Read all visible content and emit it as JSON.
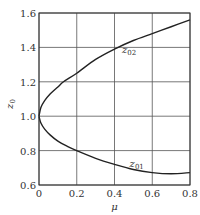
{
  "chart_data": {
    "type": "line",
    "title": "",
    "xlabel": "μ",
    "ylabel": "z",
    "ylabel_sub": "0",
    "xlim": [
      0,
      0.8
    ],
    "ylim": [
      0.6,
      1.6
    ],
    "grid": true,
    "x_ticks": [
      0,
      0.2,
      0.4,
      0.6,
      0.8
    ],
    "x_tick_labels": [
      "0",
      "0.2",
      "0.4",
      "0.6",
      "0.8"
    ],
    "y_ticks": [
      0.6,
      0.8,
      1.0,
      1.2,
      1.4,
      1.6
    ],
    "y_tick_labels": [
      "0.6",
      "0.8",
      "1.0",
      "1.2",
      "1.4",
      "1.6"
    ],
    "series": [
      {
        "name": "z02",
        "label_main": "z",
        "label_sub": "02",
        "label_at": [
          0.44,
          1.37
        ],
        "x": [
          0,
          0.01,
          0.03,
          0.06,
          0.1,
          0.13,
          0.2,
          0.3,
          0.4,
          0.5,
          0.6,
          0.7,
          0.8
        ],
        "y": [
          1.0,
          1.05,
          1.09,
          1.13,
          1.17,
          1.2,
          1.25,
          1.33,
          1.39,
          1.44,
          1.48,
          1.52,
          1.56
        ]
      },
      {
        "name": "z01",
        "label_main": "z",
        "label_sub": "01",
        "label_at": [
          0.48,
          0.705
        ],
        "x": [
          0,
          0.01,
          0.03,
          0.06,
          0.1,
          0.15,
          0.2,
          0.3,
          0.4,
          0.5,
          0.6,
          0.7,
          0.8
        ],
        "y": [
          1.0,
          0.96,
          0.925,
          0.89,
          0.855,
          0.825,
          0.8,
          0.755,
          0.72,
          0.69,
          0.672,
          0.665,
          0.672
        ]
      }
    ]
  }
}
